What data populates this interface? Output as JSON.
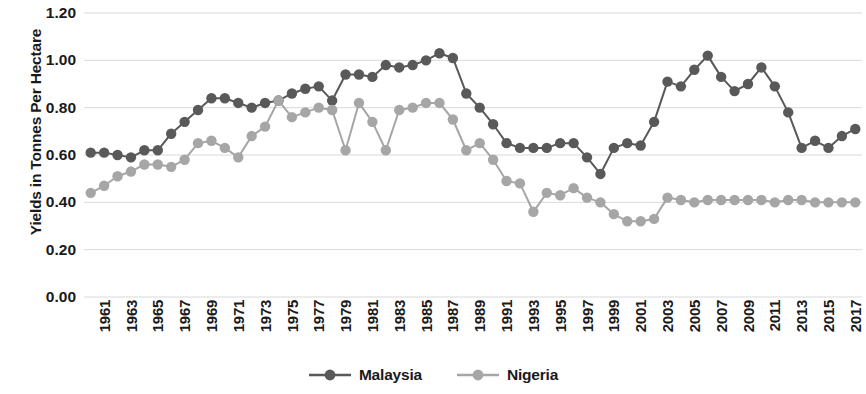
{
  "chart_data": {
    "type": "line",
    "title": "",
    "xlabel": "",
    "ylabel": "Yields in Tonnes Per Hectare",
    "ylim": [
      0.0,
      1.2
    ],
    "ytick_labels": [
      "1.20",
      "1.00",
      "0.80",
      "0.60",
      "0.40",
      "0.20",
      "0.00"
    ],
    "ytick_values": [
      1.2,
      1.0,
      0.8,
      0.6,
      0.4,
      0.2,
      0.0
    ],
    "grid": true,
    "legend_position": "bottom",
    "x": [
      1961,
      1962,
      1963,
      1964,
      1965,
      1966,
      1967,
      1968,
      1969,
      1970,
      1971,
      1972,
      1973,
      1974,
      1975,
      1976,
      1977,
      1978,
      1979,
      1980,
      1981,
      1982,
      1983,
      1984,
      1985,
      1986,
      1987,
      1988,
      1989,
      1990,
      1991,
      1992,
      1993,
      1994,
      1995,
      1996,
      1997,
      1998,
      1999,
      2000,
      2001,
      2002,
      2003,
      2004,
      2005,
      2006,
      2007,
      2008,
      2009,
      2010,
      2011,
      2012,
      2013,
      2014,
      2015,
      2016,
      2017,
      2018
    ],
    "xtick_labels": [
      "1961",
      "1963",
      "1965",
      "1967",
      "1969",
      "1971",
      "1973",
      "1975",
      "1977",
      "1979",
      "1981",
      "1983",
      "1985",
      "1987",
      "1989",
      "1991",
      "1993",
      "1995",
      "1997",
      "1999",
      "2001",
      "2003",
      "2005",
      "2007",
      "2009",
      "2011",
      "2013",
      "2015",
      "2017"
    ],
    "series": [
      {
        "name": "Malaysia",
        "color": "#595959",
        "values": [
          0.61,
          0.61,
          0.6,
          0.59,
          0.62,
          0.62,
          0.69,
          0.74,
          0.79,
          0.84,
          0.84,
          0.82,
          0.8,
          0.82,
          0.83,
          0.86,
          0.88,
          0.89,
          0.83,
          0.94,
          0.94,
          0.93,
          0.98,
          0.97,
          0.98,
          1.0,
          1.03,
          1.01,
          0.86,
          0.8,
          0.73,
          0.65,
          0.63,
          0.63,
          0.63,
          0.65,
          0.65,
          0.59,
          0.52,
          0.63,
          0.65,
          0.64,
          0.74,
          0.91,
          0.89,
          0.96,
          1.02,
          0.93,
          0.87,
          0.9,
          0.97,
          0.89,
          0.78,
          0.63,
          0.66,
          0.63,
          0.68,
          0.71
        ]
      },
      {
        "name": "Nigeria",
        "color": "#a6a6a6",
        "values": [
          0.44,
          0.47,
          0.51,
          0.53,
          0.56,
          0.56,
          0.55,
          0.58,
          0.65,
          0.66,
          0.63,
          0.59,
          0.68,
          0.72,
          0.83,
          0.76,
          0.78,
          0.8,
          0.79,
          0.62,
          0.82,
          0.74,
          0.62,
          0.79,
          0.8,
          0.82,
          0.82,
          0.75,
          0.62,
          0.65,
          0.58,
          0.49,
          0.48,
          0.36,
          0.44,
          0.43,
          0.46,
          0.42,
          0.4,
          0.35,
          0.32,
          0.32,
          0.33,
          0.42,
          0.41,
          0.4,
          0.41,
          0.41,
          0.41,
          0.41,
          0.41,
          0.4,
          0.41,
          0.41,
          0.4,
          0.4,
          0.4,
          0.4
        ]
      }
    ]
  },
  "legend": {
    "items": [
      {
        "label": "Malaysia",
        "color": "#595959"
      },
      {
        "label": "Nigeria",
        "color": "#a6a6a6"
      }
    ]
  }
}
